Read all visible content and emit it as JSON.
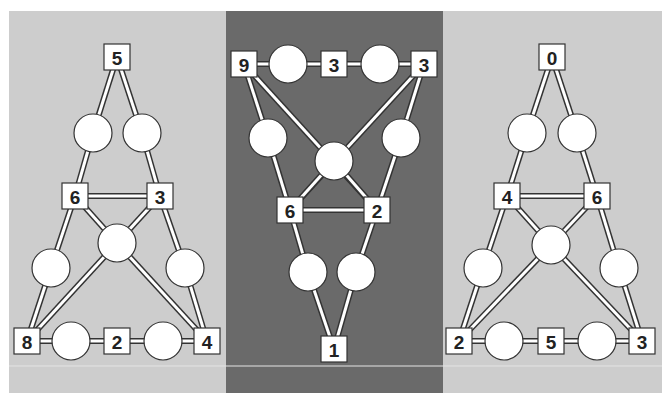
{
  "colors": {
    "light_panel": "#cdcdcd",
    "dark_panel": "#6a6a6a",
    "node_fill": "#ffffff",
    "stroke": "#333333",
    "divider": "#e4e4e4"
  },
  "puzzles": [
    {
      "id": "left",
      "panel": {
        "x": 9,
        "y": 11,
        "w": 217,
        "h": 382,
        "shade": "light"
      },
      "boxes": [
        {
          "id": "a",
          "x": 117,
          "y": 57,
          "value": "5"
        },
        {
          "id": "b",
          "x": 75,
          "y": 196,
          "value": "6"
        },
        {
          "id": "c",
          "x": 160,
          "y": 196,
          "value": "3"
        },
        {
          "id": "d",
          "x": 27,
          "y": 341,
          "value": "8"
        },
        {
          "id": "e",
          "x": 117,
          "y": 341,
          "value": "2"
        },
        {
          "id": "f",
          "x": 207,
          "y": 341,
          "value": "4"
        }
      ],
      "circles": [
        {
          "id": "p",
          "x": 93,
          "y": 133
        },
        {
          "id": "q",
          "x": 142,
          "y": 133
        },
        {
          "id": "r",
          "x": 117,
          "y": 243
        },
        {
          "id": "s",
          "x": 51,
          "y": 268
        },
        {
          "id": "t",
          "x": 185,
          "y": 268
        },
        {
          "id": "u",
          "x": 71,
          "y": 341
        },
        {
          "id": "v",
          "x": 163,
          "y": 341
        }
      ],
      "edges": [
        [
          "a",
          "p"
        ],
        [
          "a",
          "q"
        ],
        [
          "p",
          "b"
        ],
        [
          "q",
          "c"
        ],
        [
          "b",
          "c"
        ],
        [
          "b",
          "r"
        ],
        [
          "c",
          "r"
        ],
        [
          "b",
          "s"
        ],
        [
          "c",
          "t"
        ],
        [
          "s",
          "d"
        ],
        [
          "t",
          "f"
        ],
        [
          "r",
          "d"
        ],
        [
          "r",
          "f"
        ],
        [
          "d",
          "u"
        ],
        [
          "u",
          "e"
        ],
        [
          "e",
          "v"
        ],
        [
          "v",
          "f"
        ]
      ]
    },
    {
      "id": "middle",
      "panel": {
        "x": 226,
        "y": 11,
        "w": 217,
        "h": 382,
        "shade": "dark"
      },
      "boxes": [
        {
          "id": "a",
          "x": 244,
          "y": 64,
          "value": "9"
        },
        {
          "id": "b",
          "x": 334,
          "y": 64,
          "value": "3"
        },
        {
          "id": "c",
          "x": 424,
          "y": 64,
          "value": "3"
        },
        {
          "id": "d",
          "x": 290,
          "y": 210,
          "value": "6"
        },
        {
          "id": "e",
          "x": 377,
          "y": 210,
          "value": "2"
        },
        {
          "id": "f",
          "x": 334,
          "y": 349,
          "value": "1"
        }
      ],
      "circles": [
        {
          "id": "p",
          "x": 288,
          "y": 64
        },
        {
          "id": "q",
          "x": 380,
          "y": 64
        },
        {
          "id": "r",
          "x": 268,
          "y": 138
        },
        {
          "id": "s",
          "x": 401,
          "y": 138
        },
        {
          "id": "t",
          "x": 334,
          "y": 161
        },
        {
          "id": "u",
          "x": 308,
          "y": 272
        },
        {
          "id": "v",
          "x": 356,
          "y": 272
        }
      ],
      "edges": [
        [
          "a",
          "p"
        ],
        [
          "p",
          "b"
        ],
        [
          "b",
          "q"
        ],
        [
          "q",
          "c"
        ],
        [
          "a",
          "r"
        ],
        [
          "c",
          "s"
        ],
        [
          "r",
          "d"
        ],
        [
          "s",
          "e"
        ],
        [
          "a",
          "e"
        ],
        [
          "c",
          "d"
        ],
        [
          "t",
          "d"
        ],
        [
          "t",
          "e"
        ],
        [
          "d",
          "e"
        ],
        [
          "d",
          "u"
        ],
        [
          "e",
          "v"
        ],
        [
          "u",
          "f"
        ],
        [
          "v",
          "f"
        ]
      ]
    },
    {
      "id": "right",
      "panel": {
        "x": 443,
        "y": 11,
        "w": 219,
        "h": 382,
        "shade": "light"
      },
      "boxes": [
        {
          "id": "a",
          "x": 552,
          "y": 57,
          "value": "0"
        },
        {
          "id": "b",
          "x": 507,
          "y": 196,
          "value": "4"
        },
        {
          "id": "c",
          "x": 597,
          "y": 196,
          "value": "6"
        },
        {
          "id": "d",
          "x": 459,
          "y": 341,
          "value": "2"
        },
        {
          "id": "e",
          "x": 551,
          "y": 341,
          "value": "5"
        },
        {
          "id": "f",
          "x": 642,
          "y": 341,
          "value": "3"
        }
      ],
      "circles": [
        {
          "id": "p",
          "x": 527,
          "y": 133
        },
        {
          "id": "q",
          "x": 577,
          "y": 133
        },
        {
          "id": "r",
          "x": 551,
          "y": 245
        },
        {
          "id": "s",
          "x": 483,
          "y": 268
        },
        {
          "id": "t",
          "x": 619,
          "y": 268
        },
        {
          "id": "u",
          "x": 504,
          "y": 341
        },
        {
          "id": "v",
          "x": 597,
          "y": 341
        }
      ],
      "edges": [
        [
          "a",
          "p"
        ],
        [
          "a",
          "q"
        ],
        [
          "p",
          "b"
        ],
        [
          "q",
          "c"
        ],
        [
          "b",
          "c"
        ],
        [
          "b",
          "r"
        ],
        [
          "c",
          "r"
        ],
        [
          "b",
          "s"
        ],
        [
          "c",
          "t"
        ],
        [
          "s",
          "d"
        ],
        [
          "t",
          "f"
        ],
        [
          "r",
          "d"
        ],
        [
          "r",
          "f"
        ],
        [
          "d",
          "u"
        ],
        [
          "u",
          "e"
        ],
        [
          "e",
          "v"
        ],
        [
          "v",
          "f"
        ]
      ]
    }
  ],
  "layout": {
    "box_size": 26,
    "circle_r": 19,
    "divider_y": 366
  }
}
